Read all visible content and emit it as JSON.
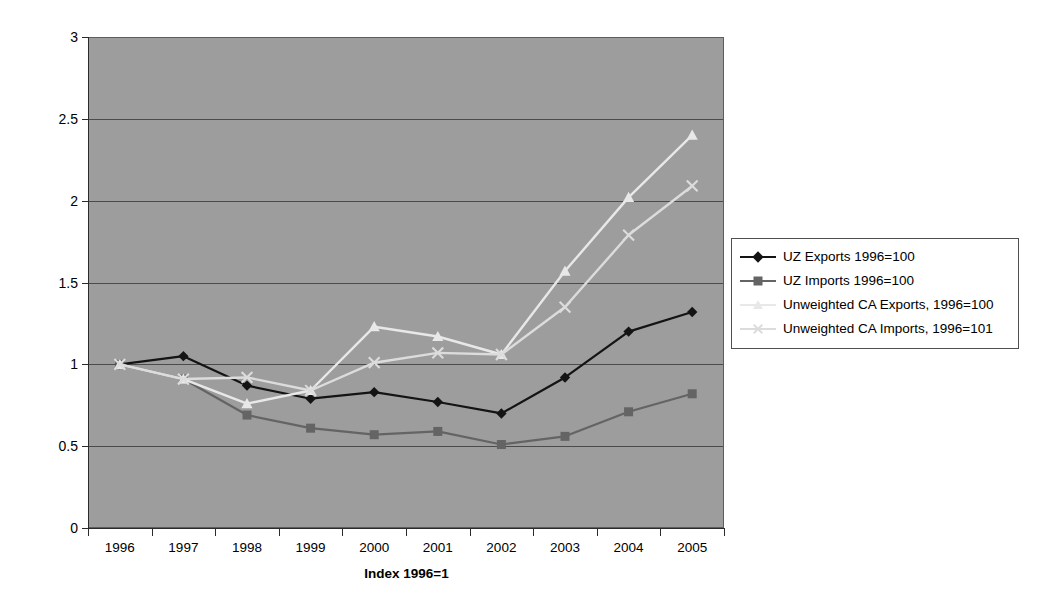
{
  "chart_data": {
    "type": "line",
    "title": "",
    "xlabel": "Index 1996=1",
    "ylabel": "",
    "categories": [
      "1996",
      "1997",
      "1998",
      "1999",
      "2000",
      "2001",
      "2002",
      "2003",
      "2004",
      "2005"
    ],
    "x": [
      1996,
      1997,
      1998,
      1999,
      2000,
      2001,
      2002,
      2003,
      2004,
      2005
    ],
    "ylim": [
      0,
      3
    ],
    "yticks": [
      "0",
      "0.5",
      "1",
      "1.5",
      "2",
      "2.5",
      "3"
    ],
    "ytick_values": [
      0,
      0.5,
      1,
      1.5,
      2,
      2.5,
      3
    ],
    "grid": true,
    "legend_position": "right",
    "plot_background": "#9d9d9d",
    "series": [
      {
        "name": "UZ Exports 1996=100",
        "color": "#141414",
        "marker": "diamond",
        "values": [
          1.0,
          1.05,
          0.87,
          0.79,
          0.83,
          0.77,
          0.7,
          0.92,
          1.2,
          1.32
        ]
      },
      {
        "name": "UZ Imports 1996=100",
        "color": "#646464",
        "marker": "square",
        "values": [
          1.0,
          0.91,
          0.69,
          0.61,
          0.57,
          0.59,
          0.51,
          0.56,
          0.71,
          0.82
        ]
      },
      {
        "name": "Unweighted CA Exports, 1996=100",
        "color": "#e8e8e8",
        "marker": "triangle",
        "values": [
          1.0,
          0.91,
          0.76,
          0.84,
          1.23,
          1.17,
          1.06,
          1.57,
          2.02,
          2.4
        ]
      },
      {
        "name": "Unweighted CA Imports, 1996=101",
        "color": "#dcdcdc",
        "marker": "cross",
        "values": [
          1.0,
          0.91,
          0.92,
          0.84,
          1.01,
          1.07,
          1.06,
          1.35,
          1.79,
          2.09
        ]
      }
    ]
  }
}
